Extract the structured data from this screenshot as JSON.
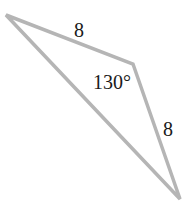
{
  "figure": {
    "type": "triangle",
    "stroke_color": "#b5b5b5",
    "vertices": [
      {
        "x": 6,
        "y": 15
      },
      {
        "x": 133,
        "y": 64
      },
      {
        "x": 180,
        "y": 199
      }
    ],
    "labels": {
      "side_top": "8",
      "angle": "130°",
      "side_right": "8"
    }
  }
}
